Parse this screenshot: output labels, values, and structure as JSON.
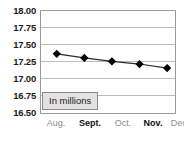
{
  "chart_data": {
    "type": "line",
    "title": "",
    "subtitle": "",
    "xlabel": "",
    "ylabel": "",
    "annotation": "In millions",
    "categories": [
      "Aug.",
      "Sept.",
      "Oct.",
      "Nov.",
      "Dec."
    ],
    "category_emphasis": [
      "normal",
      "bold",
      "normal",
      "bold",
      "normal"
    ],
    "values": [
      17.37,
      17.31,
      17.26,
      17.22,
      17.16
    ],
    "series": [
      {
        "name": "",
        "values": [
          17.37,
          17.31,
          17.26,
          17.22,
          17.16
        ]
      }
    ],
    "ylim": [
      16.5,
      18.0
    ],
    "ytick_values": [
      18.0,
      17.75,
      17.5,
      17.25,
      17.0,
      16.75,
      16.5
    ],
    "ytick_labels": [
      "18.00",
      "17.75",
      "17.50",
      "17.25",
      "17.00",
      "16.75",
      "16.50"
    ],
    "grid": true,
    "grid_axis": "y",
    "legend": false,
    "legend_position": "none",
    "marker": "diamond",
    "marker_color": "#000000",
    "line_color": "#2b2b2b",
    "plot_border_color": "#9a9a9a",
    "gridline_color": "#bdbdbd",
    "background_color": "#ffffff",
    "annotation_box_fill": "#e2e2e2",
    "annotation_box_border": "#8a8a8a"
  }
}
